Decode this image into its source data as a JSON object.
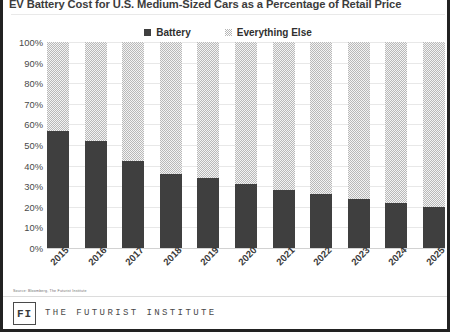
{
  "title": "EV Battery Cost for U.S. Medium-Sized Cars as a Percentage of Retail Price",
  "footer": {
    "source": "Source: Bloomberg, The Futurist Institute",
    "logo_text": "FI",
    "org_name": "THE FUTURIST INSTITUTE"
  },
  "colors": {
    "battery": "#3f3f3f",
    "everything_else": "#b9b9b9",
    "gridline": "#e8e8e8",
    "frame": "#222222"
  },
  "chart_data": {
    "type": "bar",
    "subtype": "stacked-100",
    "title": "EV Battery Cost for U.S. Medium-Sized Cars as a Percentage of Retail Price",
    "xlabel": "",
    "ylabel": "",
    "ylim": [
      0,
      100
    ],
    "yticks": [
      "0%",
      "10%",
      "20%",
      "30%",
      "40%",
      "50%",
      "60%",
      "70%",
      "80%",
      "90%",
      "100%"
    ],
    "ytick_values": [
      0,
      10,
      20,
      30,
      40,
      50,
      60,
      70,
      80,
      90,
      100
    ],
    "grid": true,
    "legend_position": "top-center",
    "categories": [
      "2015",
      "2016",
      "2017",
      "2018",
      "2019",
      "2020",
      "2021",
      "2022",
      "2023",
      "2024",
      "2025"
    ],
    "series": [
      {
        "name": "Battery",
        "color": "#3f3f3f",
        "values": [
          57,
          52,
          42,
          36,
          34,
          31,
          28,
          26,
          24,
          22,
          20
        ]
      },
      {
        "name": "Everything Else",
        "color": "#b9b9b9",
        "values": [
          43,
          48,
          58,
          64,
          66,
          69,
          72,
          74,
          76,
          78,
          80
        ]
      }
    ]
  }
}
